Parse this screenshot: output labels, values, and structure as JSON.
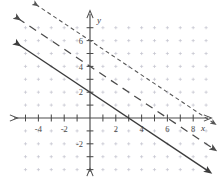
{
  "chart_data": {
    "type": "line",
    "title": "",
    "xlabel": "x",
    "ylabel": "y",
    "xlim": [
      -5.8,
      9.8
    ],
    "ylim": [
      -4.5,
      8.2
    ],
    "grid": true,
    "grid_style": "dotted-lattice",
    "legend_position": "none",
    "x_tick_labels": [
      "-4",
      "-2",
      "2",
      "4",
      "6",
      "8"
    ],
    "x_tick_values": [
      -4,
      -2,
      2,
      4,
      6,
      8
    ],
    "y_tick_labels": [
      "6",
      "4",
      "2",
      "-2"
    ],
    "y_tick_values": [
      6,
      4,
      2,
      -2
    ],
    "series": [
      {
        "name": "solid-line",
        "style": "solid",
        "color": "#3c3c3c",
        "slope": -0.6667,
        "intercept": 2,
        "x_intercept": 3,
        "y_intercept": 2,
        "arrows": "both",
        "x_start": -5.6,
        "x_end": 9.2
      },
      {
        "name": "long-dashed-line",
        "style": "dashed",
        "color": "#4a4a4a",
        "slope": -0.6667,
        "intercept": 4,
        "x_intercept": 6,
        "y_intercept": 4,
        "arrows": "both",
        "x_start": -5.6,
        "x_end": 9.6
      },
      {
        "name": "short-dashed-line",
        "style": "short-dashed",
        "color": "#555555",
        "slope": -0.6667,
        "intercept": 6,
        "x_intercept": 9,
        "y_intercept": 6,
        "arrows": "both",
        "x_start": -4.2,
        "x_end": 9.6
      }
    ]
  },
  "axes": {
    "x_axis_label": "x",
    "y_axis_label": "y",
    "origin_label": ""
  },
  "colors": {
    "axis": "#4a4a4a",
    "grid_dot": "#b8b8c4",
    "solid_line": "#3c3c3c",
    "dashed_line": "#4a4a4a",
    "short_dashed_line": "#555555",
    "background": "#ffffff",
    "text": "#4a4a4a"
  }
}
